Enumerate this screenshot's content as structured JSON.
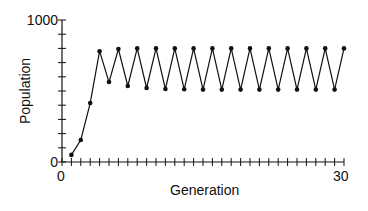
{
  "chart_data": {
    "type": "line",
    "title": "",
    "xlabel": "Generation",
    "ylabel": "Population",
    "xlim": [
      0,
      30
    ],
    "ylim": [
      0,
      1000
    ],
    "x_tick_labels": [
      "0",
      "30"
    ],
    "y_tick_labels": [
      "0",
      "1000"
    ],
    "x_minor_tick_step": 1,
    "y_minor_tick_step": 100,
    "grid": false,
    "legend": null,
    "series": [
      {
        "name": "Population",
        "markers": true,
        "x": [
          1,
          2,
          3,
          4,
          5,
          6,
          7,
          8,
          9,
          10,
          11,
          12,
          13,
          14,
          15,
          16,
          17,
          18,
          19,
          20,
          21,
          22,
          23,
          24,
          25,
          26,
          27,
          28,
          29,
          30
        ],
        "values": [
          50,
          155,
          415,
          780,
          563,
          795,
          535,
          800,
          521,
          800,
          514,
          800,
          512,
          800,
          510,
          800,
          510,
          800,
          510,
          800,
          510,
          800,
          510,
          800,
          510,
          800,
          510,
          800,
          510,
          800
        ]
      }
    ]
  },
  "labels": {
    "y_top": "1000",
    "y_bottom": "0",
    "x_left": "0",
    "x_right": "30",
    "x_axis_title": "Generation",
    "y_axis_title": "Population"
  }
}
